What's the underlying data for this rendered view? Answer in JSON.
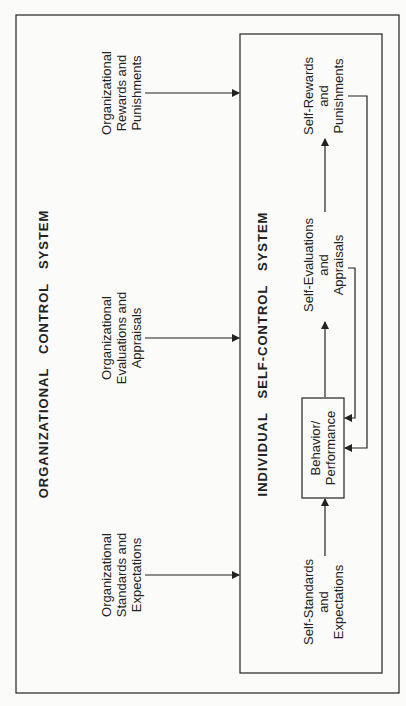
{
  "outer": {
    "title": "ORGANIZATIONAL   CONTROL   SYSTEM",
    "inputs": [
      {
        "label": "Organizational\nStandards and\nExpectations"
      },
      {
        "label": "Organizational\nEvaluations and\nAppraisals"
      },
      {
        "label": "Organizational\nRewards and\nPunishments"
      }
    ]
  },
  "inner": {
    "title": "INDIVIDUAL   SELF-CONTROL   SYSTEM",
    "nodes": {
      "standards": "Self-Standards\nand\nExpectations",
      "behavior": "Behavior/\nPerformance",
      "evaluations": "Self-Evaluations\nand\nAppraisals",
      "rewards": "Self-Rewards\nand\nPunishments"
    }
  }
}
